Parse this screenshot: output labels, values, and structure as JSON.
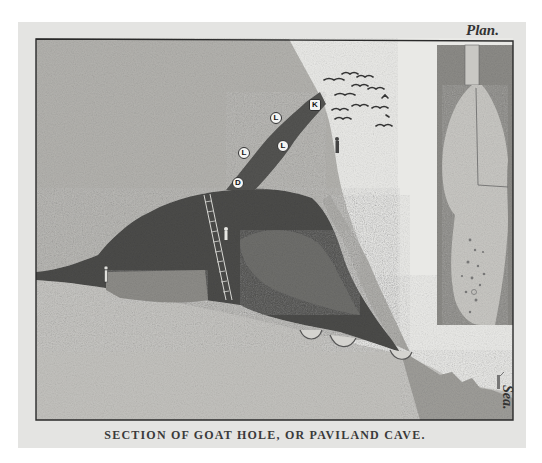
{
  "illustration": {
    "caption": "SECTION OF GOAT HOLE, OR PAVILAND CAVE.",
    "plan_label": "Plan.",
    "sea_label": "Sea.",
    "markers": [
      {
        "id": "marker-k",
        "label": "K"
      },
      {
        "id": "marker-l-upper",
        "label": "L"
      },
      {
        "id": "marker-l-right",
        "label": "L"
      },
      {
        "id": "marker-l-left",
        "label": "L"
      },
      {
        "id": "marker-d",
        "label": "D"
      }
    ]
  },
  "colors": {
    "paper": "#e4e4e2",
    "rock": "#b3b2ae",
    "cave_dark": "#4a4a48",
    "sky": "#e9e9e6",
    "ink": "#2a2a2a"
  }
}
